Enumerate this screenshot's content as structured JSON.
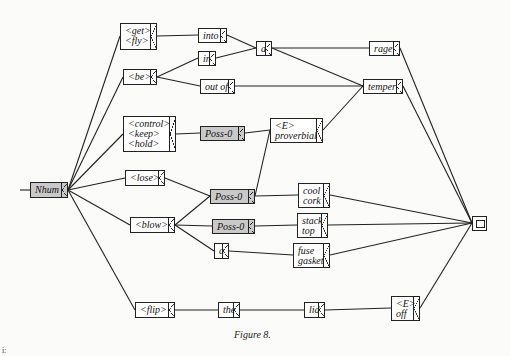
{
  "diagram": {
    "caption": "Figure 8.",
    "corner_mark": "i:",
    "nodes": {
      "nhum": {
        "lines": [
          "Nhum"
        ],
        "shaded": true
      },
      "get_fly": {
        "lines": [
          "<get>",
          "<fly>"
        ]
      },
      "be": {
        "lines": [
          "<be>"
        ]
      },
      "control_keep_hold": {
        "lines": [
          "<control>",
          "<keep>",
          "<hold>"
        ]
      },
      "lose": {
        "lines": [
          "<lose>"
        ]
      },
      "blow": {
        "lines": [
          "<blow>"
        ]
      },
      "flip": {
        "lines": [
          "<flip>"
        ]
      },
      "into": {
        "lines": [
          "into"
        ]
      },
      "in": {
        "lines": [
          "in"
        ]
      },
      "out_of": {
        "lines": [
          "out of"
        ]
      },
      "a_top": {
        "lines": [
          "a"
        ]
      },
      "poss0_top": {
        "lines": [
          "Poss-0"
        ],
        "shaded": true
      },
      "poss0_mid": {
        "lines": [
          "Poss-0"
        ],
        "shaded": true
      },
      "poss0_low": {
        "lines": [
          "Poss-0"
        ],
        "shaded": true
      },
      "a_low": {
        "lines": [
          "a"
        ]
      },
      "the": {
        "lines": [
          "the"
        ]
      },
      "e_proverbial": {
        "lines": [
          "<E>",
          "proverbial"
        ]
      },
      "cool_cork": {
        "lines": [
          "cool",
          "cork"
        ]
      },
      "stack_top": {
        "lines": [
          "stack",
          "top"
        ]
      },
      "fuse_gasket": {
        "lines": [
          "fuse",
          "gasket"
        ]
      },
      "lid": {
        "lines": [
          "lid"
        ]
      },
      "rage": {
        "lines": [
          "rage"
        ]
      },
      "temper": {
        "lines": [
          "temper"
        ]
      },
      "e_off": {
        "lines": [
          "<E>",
          "off"
        ]
      },
      "final": {
        "lines": [],
        "type": "final-state"
      }
    },
    "edges": [
      [
        "start",
        "nhum"
      ],
      [
        "nhum",
        "get_fly"
      ],
      [
        "nhum",
        "be"
      ],
      [
        "nhum",
        "control_keep_hold"
      ],
      [
        "nhum",
        "lose"
      ],
      [
        "nhum",
        "blow"
      ],
      [
        "nhum",
        "flip"
      ],
      [
        "get_fly",
        "into"
      ],
      [
        "be",
        "in"
      ],
      [
        "be",
        "out_of"
      ],
      [
        "into",
        "a_top"
      ],
      [
        "in",
        "a_top"
      ],
      [
        "a_top",
        "rage"
      ],
      [
        "a_top",
        "temper"
      ],
      [
        "out_of",
        "temper"
      ],
      [
        "control_keep_hold",
        "poss0_top"
      ],
      [
        "poss0_top",
        "e_proverbial"
      ],
      [
        "lose",
        "poss0_mid"
      ],
      [
        "blow",
        "poss0_mid"
      ],
      [
        "blow",
        "poss0_low"
      ],
      [
        "blow",
        "a_low"
      ],
      [
        "poss0_mid",
        "e_proverbial"
      ],
      [
        "poss0_mid",
        "cool_cork"
      ],
      [
        "e_proverbial",
        "temper"
      ],
      [
        "poss0_low",
        "stack_top"
      ],
      [
        "a_low",
        "fuse_gasket"
      ],
      [
        "flip",
        "the"
      ],
      [
        "the",
        "lid"
      ],
      [
        "lid",
        "e_off"
      ],
      [
        "rage",
        "final"
      ],
      [
        "temper",
        "final"
      ],
      [
        "cool_cork",
        "final"
      ],
      [
        "stack_top",
        "final"
      ],
      [
        "fuse_gasket",
        "final"
      ],
      [
        "e_off",
        "final"
      ]
    ]
  }
}
